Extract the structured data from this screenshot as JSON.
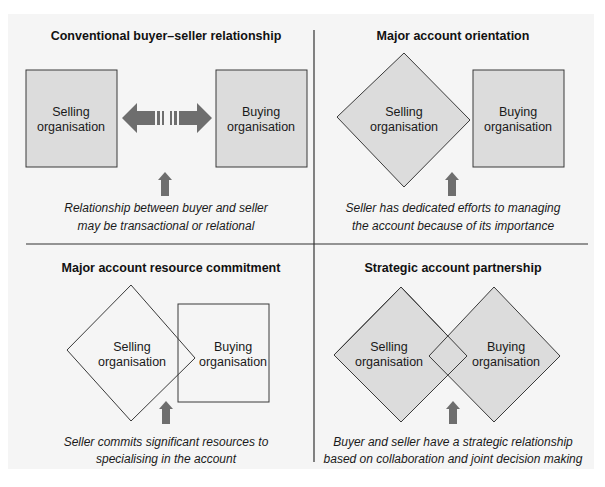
{
  "figure": {
    "colors": {
      "panel_background": "#f5f5f5",
      "shape_fill": "#dcdcdc",
      "shape_stroke": "#3a3a3a",
      "arrow_fill": "#6e6e6e",
      "divider": "#333333"
    },
    "quadrants": [
      {
        "title": "Conventional buyer–seller relationship",
        "seller_shape": "square",
        "buyer_shape": "square",
        "seller_label": [
          "Selling",
          "organisation"
        ],
        "buyer_label": [
          "Buying",
          "organisation"
        ],
        "connector": "broken-double-arrow",
        "caption": [
          "Relationship between buyer and seller",
          "may be transactional or relational"
        ]
      },
      {
        "title": "Major account orientation",
        "seller_shape": "diamond",
        "buyer_shape": "square",
        "seller_label": [
          "Selling",
          "organisation"
        ],
        "buyer_label": [
          "Buying",
          "organisation"
        ],
        "connector": "touching",
        "caption": [
          "Seller has dedicated efforts to managing",
          "the account because of its importance"
        ]
      },
      {
        "title": "Major account resource commitment",
        "seller_shape": "diamond-outline",
        "buyer_shape": "square-outline",
        "seller_label": [
          "Selling",
          "organisation"
        ],
        "buyer_label": [
          "Buying",
          "organisation"
        ],
        "connector": "overlapping",
        "caption": [
          "Seller commits significant resources to",
          "specialising in the account"
        ]
      },
      {
        "title": "Strategic account partnership",
        "seller_shape": "diamond",
        "buyer_shape": "diamond",
        "seller_label": [
          "Selling",
          "organisation"
        ],
        "buyer_label": [
          "Buying",
          "organisation"
        ],
        "connector": "overlapping",
        "caption": [
          "Buyer and seller have a strategic relationship",
          "based on collaboration and joint decision making"
        ]
      }
    ]
  }
}
